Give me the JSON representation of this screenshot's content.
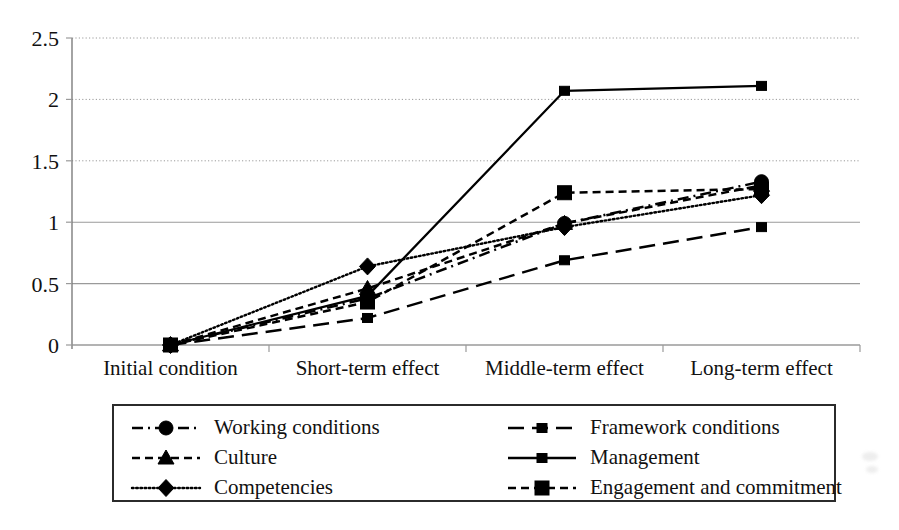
{
  "chart_data": {
    "type": "line",
    "title": "",
    "subtitle": "",
    "xlabel": "",
    "ylabel": "",
    "categories": [
      "Initial condition",
      "Short-term effect",
      "Middle-term effect",
      "Long-term effect"
    ],
    "ylim": [
      0,
      2.5
    ],
    "yticks": [
      0,
      0.5,
      1,
      1.5,
      2,
      2.5
    ],
    "ytick_labels": [
      "0",
      "0.5",
      "1",
      "1.5",
      "2",
      "2.5"
    ],
    "grid": true,
    "grid_axis": "y",
    "legend_position": "below-plot",
    "legend_columns": 2,
    "series": [
      {
        "name": "Working conditions",
        "values": [
          0,
          0.38,
          0.99,
          1.33
        ],
        "marker": "circle",
        "linestyle": "dash-dot",
        "color": "#000000"
      },
      {
        "name": "Framework conditions",
        "values": [
          0,
          0.22,
          0.69,
          0.96
        ],
        "marker": "small-square",
        "linestyle": "long-dash",
        "color": "#000000"
      },
      {
        "name": "Culture",
        "values": [
          0,
          0.46,
          0.99,
          1.3
        ],
        "marker": "triangle",
        "linestyle": "dashed",
        "color": "#000000"
      },
      {
        "name": "Management",
        "values": [
          0,
          0.4,
          2.07,
          2.11
        ],
        "marker": "small-square",
        "linestyle": "solid",
        "color": "#000000"
      },
      {
        "name": "Competencies",
        "values": [
          0,
          0.64,
          0.96,
          1.22
        ],
        "marker": "diamond",
        "linestyle": "dotted",
        "color": "#000000"
      },
      {
        "name": "Engagement and commitment",
        "values": [
          0,
          0.35,
          1.24,
          1.27
        ],
        "marker": "square",
        "linestyle": "dashed",
        "color": "#000000"
      }
    ]
  },
  "legend": {
    "entries": [
      {
        "label": "Working conditions",
        "marker": "circle",
        "linestyle": "dash-dot"
      },
      {
        "label": "Framework conditions",
        "marker": "small-square",
        "linestyle": "long-dash"
      },
      {
        "label": "Culture",
        "marker": "triangle",
        "linestyle": "dashed"
      },
      {
        "label": "Management",
        "marker": "small-square",
        "linestyle": "solid"
      },
      {
        "label": "Competencies",
        "marker": "diamond",
        "linestyle": "dotted"
      },
      {
        "label": "Engagement and commitment",
        "marker": "square",
        "linestyle": "dashed"
      }
    ]
  },
  "colors": {
    "ink": "#000000",
    "grid": "#9a9a9a",
    "axis": "#7d7d7d",
    "background": "#ffffff"
  }
}
